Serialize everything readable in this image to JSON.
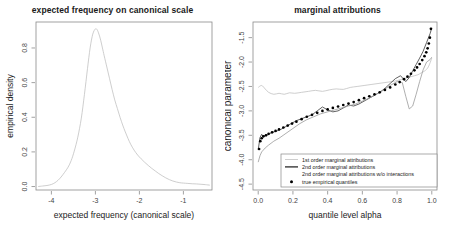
{
  "figure": {
    "width": 450,
    "height": 235,
    "background": "#ffffff"
  },
  "chart_data": [
    {
      "type": "line",
      "panel": "left",
      "title": "expected frequency on canonical scale",
      "xlabel": "expected frequency (canonical scale)",
      "ylabel": "empirical density",
      "xlim": [
        -4.35,
        -0.35
      ],
      "ylim": [
        -0.02,
        0.95
      ],
      "xticks": [
        "-4",
        "-3",
        "-2",
        "-1"
      ],
      "xtick_values": [
        -4,
        -3,
        -2,
        -1
      ],
      "yticks": [
        "0.0",
        "0.2",
        "0.4",
        "0.6",
        "0.8"
      ],
      "ytick_values": [
        0.0,
        0.2,
        0.4,
        0.6,
        0.8
      ],
      "grid": false,
      "legend": "none",
      "series": [
        {
          "name": "empirical density",
          "color": "#555555",
          "x": [
            -4.3,
            -4.2,
            -4.1,
            -4.0,
            -3.92,
            -3.85,
            -3.78,
            -3.7,
            -3.62,
            -3.55,
            -3.48,
            -3.4,
            -3.32,
            -3.25,
            -3.18,
            -3.12,
            -3.06,
            -3.0,
            -2.96,
            -2.92,
            -2.88,
            -2.84,
            -2.8,
            -2.74,
            -2.68,
            -2.62,
            -2.56,
            -2.5,
            -2.44,
            -2.38,
            -2.32,
            -2.26,
            -2.2,
            -2.12,
            -2.04,
            -1.96,
            -1.88,
            -1.8,
            -1.72,
            -1.64,
            -1.56,
            -1.48,
            -1.4,
            -1.32,
            -1.24,
            -1.16,
            -1.08,
            -1.0,
            -0.9,
            -0.8,
            -0.7,
            -0.6,
            -0.5,
            -0.4
          ],
          "y": [
            0.0,
            0.003,
            0.006,
            0.012,
            0.022,
            0.036,
            0.055,
            0.082,
            0.112,
            0.15,
            0.205,
            0.285,
            0.395,
            0.53,
            0.68,
            0.8,
            0.88,
            0.91,
            0.905,
            0.88,
            0.845,
            0.8,
            0.755,
            0.69,
            0.625,
            0.56,
            0.5,
            0.45,
            0.4,
            0.355,
            0.315,
            0.278,
            0.245,
            0.21,
            0.182,
            0.16,
            0.14,
            0.122,
            0.105,
            0.09,
            0.075,
            0.062,
            0.05,
            0.04,
            0.032,
            0.026,
            0.022,
            0.02,
            0.018,
            0.016,
            0.015,
            0.013,
            0.011,
            0.008
          ]
        }
      ]
    },
    {
      "type": "line",
      "panel": "right",
      "title": "marginal attributions",
      "xlabel": "quantile level alpha",
      "ylabel": "canonical parameter",
      "xlim": [
        -0.03,
        1.03
      ],
      "ylim": [
        -4.62,
        -1.18
      ],
      "xticks": [
        "0.0",
        "0.2",
        "0.4",
        "0.6",
        "0.8",
        "1.0"
      ],
      "xtick_values": [
        0.0,
        0.2,
        0.4,
        0.6,
        0.8,
        1.0
      ],
      "yticks": [
        "-1.5",
        "-2.0",
        "-2.5",
        "-3.0",
        "-3.5",
        "-4.0",
        "-4.5"
      ],
      "ytick_values": [
        -1.5,
        -2.0,
        -2.5,
        -3.0,
        -3.5,
        -4.0,
        -4.5
      ],
      "grid": false,
      "legend_position": "bottom-center",
      "series": [
        {
          "name": "1st order marginal attributions",
          "color": "#c2c2c2",
          "style": "line",
          "x": [
            0.0,
            0.02,
            0.04,
            0.06,
            0.09,
            0.12,
            0.15,
            0.18,
            0.21,
            0.25,
            0.29,
            0.33,
            0.37,
            0.41,
            0.45,
            0.49,
            0.53,
            0.57,
            0.61,
            0.65,
            0.69,
            0.73,
            0.77,
            0.8,
            0.83,
            0.86,
            0.88,
            0.9,
            0.92,
            0.94,
            0.96,
            0.98,
            1.0
          ],
          "y": [
            -2.52,
            -2.48,
            -2.55,
            -2.62,
            -2.66,
            -2.64,
            -2.66,
            -2.63,
            -2.64,
            -2.62,
            -2.6,
            -2.58,
            -2.6,
            -2.57,
            -2.55,
            -2.56,
            -2.52,
            -2.5,
            -2.48,
            -2.46,
            -2.44,
            -2.42,
            -2.4,
            -2.38,
            -2.35,
            -2.32,
            -2.3,
            -2.28,
            -2.26,
            -2.22,
            -2.18,
            -2.1,
            -1.92
          ]
        },
        {
          "name": "2nd order marginal attributions",
          "color": "#3a3a3a",
          "style": "line",
          "x": [
            0.0,
            0.01,
            0.02,
            0.03,
            0.04,
            0.06,
            0.08,
            0.1,
            0.13,
            0.16,
            0.19,
            0.22,
            0.25,
            0.28,
            0.31,
            0.34,
            0.37,
            0.4,
            0.43,
            0.46,
            0.49,
            0.52,
            0.55,
            0.58,
            0.61,
            0.64,
            0.67,
            0.7,
            0.73,
            0.76,
            0.79,
            0.82,
            0.85,
            0.87,
            0.89,
            0.91,
            0.93,
            0.95,
            0.97,
            0.99,
            1.0
          ],
          "y": [
            -3.8,
            -3.55,
            -3.48,
            -3.53,
            -3.5,
            -3.48,
            -3.44,
            -3.42,
            -3.38,
            -3.32,
            -3.26,
            -3.2,
            -3.16,
            -3.12,
            -3.08,
            -3.0,
            -2.92,
            -2.98,
            -3.02,
            -3.0,
            -2.94,
            -2.88,
            -2.9,
            -2.86,
            -2.8,
            -2.74,
            -2.68,
            -2.62,
            -2.54,
            -2.44,
            -2.34,
            -2.28,
            -2.4,
            -2.32,
            -2.18,
            -2.05,
            -1.92,
            -1.78,
            -1.6,
            -1.42,
            -1.3
          ]
        },
        {
          "name": "2nd order marginal attributions w/o interactions",
          "color": "#9a9a9a",
          "style": "line",
          "x": [
            0.0,
            0.01,
            0.02,
            0.04,
            0.06,
            0.09,
            0.12,
            0.16,
            0.2,
            0.24,
            0.28,
            0.32,
            0.36,
            0.4,
            0.44,
            0.48,
            0.52,
            0.56,
            0.6,
            0.64,
            0.68,
            0.72,
            0.76,
            0.8,
            0.83,
            0.85,
            0.87,
            0.89,
            0.91,
            0.93,
            0.95,
            0.97,
            0.99,
            1.0
          ],
          "y": [
            -4.05,
            -3.92,
            -3.84,
            -3.76,
            -3.7,
            -3.62,
            -3.56,
            -3.46,
            -3.36,
            -3.26,
            -3.18,
            -3.12,
            -3.06,
            -3.02,
            -2.98,
            -2.94,
            -2.9,
            -2.86,
            -2.8,
            -2.74,
            -2.66,
            -2.58,
            -2.48,
            -2.4,
            -2.42,
            -2.7,
            -2.96,
            -2.9,
            -2.66,
            -2.4,
            -2.16,
            -2.0,
            -1.95,
            -1.9
          ]
        },
        {
          "name": "true empirical quantiles",
          "color": "#000000",
          "style": "points",
          "x": [
            0.005,
            0.012,
            0.02,
            0.03,
            0.045,
            0.06,
            0.08,
            0.1,
            0.12,
            0.145,
            0.17,
            0.195,
            0.22,
            0.25,
            0.28,
            0.31,
            0.34,
            0.37,
            0.4,
            0.43,
            0.46,
            0.49,
            0.52,
            0.55,
            0.58,
            0.61,
            0.64,
            0.67,
            0.7,
            0.73,
            0.76,
            0.79,
            0.815,
            0.84,
            0.86,
            0.88,
            0.9,
            0.915,
            0.93,
            0.945,
            0.958,
            0.968,
            0.976,
            0.983,
            0.989,
            0.995
          ],
          "y": [
            -3.78,
            -3.62,
            -3.56,
            -3.52,
            -3.5,
            -3.47,
            -3.44,
            -3.41,
            -3.38,
            -3.34,
            -3.3,
            -3.26,
            -3.22,
            -3.17,
            -3.12,
            -3.08,
            -3.04,
            -3.0,
            -2.97,
            -2.94,
            -2.91,
            -2.88,
            -2.85,
            -2.82,
            -2.78,
            -2.74,
            -2.7,
            -2.66,
            -2.62,
            -2.57,
            -2.52,
            -2.46,
            -2.41,
            -2.35,
            -2.3,
            -2.24,
            -2.17,
            -2.11,
            -2.04,
            -1.96,
            -1.88,
            -1.8,
            -1.72,
            -1.62,
            -1.5,
            -1.32
          ]
        }
      ]
    }
  ],
  "legend": {
    "items": [
      {
        "label": "1st order marginal attributions",
        "marker": "line",
        "color": "#c2c2c2"
      },
      {
        "label": "2nd order marginal attributions",
        "marker": "line",
        "color": "#2a2a2a"
      },
      {
        "label": "2nd order marginal attributions w/o interactions",
        "marker": "none",
        "color": "#9a9a9a"
      },
      {
        "label": "true empirical quantiles",
        "marker": "point",
        "color": "#000000"
      }
    ]
  }
}
